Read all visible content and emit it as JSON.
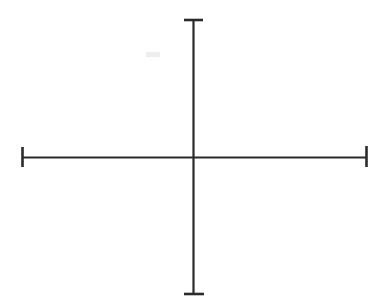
{
  "figure": {
    "kind": "axes-cross-diagram",
    "title": "Blank coordinate axes cross",
    "canvas": {
      "width": 380,
      "height": 308,
      "background": "#ffffff"
    },
    "stroke": {
      "color": "#2b2b2b",
      "axis_width": 2,
      "cap_width": 2.6
    },
    "origin": {
      "x": 193,
      "y": 157
    },
    "horizontal_axis": {
      "label": "horizontal-axis",
      "x1": 22,
      "y1": 157,
      "x2": 367,
      "y2": 157
    },
    "vertical_axis": {
      "label": "vertical-axis",
      "x1": 193,
      "y1": 19,
      "x2": 193,
      "y2": 295
    },
    "end_caps": [
      {
        "name": "top-cap",
        "orientation": "horizontal",
        "x1": 184,
        "y1": 20,
        "x2": 203,
        "y2": 20
      },
      {
        "name": "bottom-cap",
        "orientation": "horizontal",
        "x1": 184,
        "y1": 294,
        "x2": 204,
        "y2": 294
      },
      {
        "name": "left-cap",
        "orientation": "vertical",
        "x1": 22,
        "y1": 147,
        "x2": 22,
        "y2": 167
      },
      {
        "name": "right-cap",
        "orientation": "vertical",
        "x1": 366,
        "y1": 146,
        "x2": 366,
        "y2": 167
      }
    ],
    "artifacts": [
      {
        "name": "scan-smudge",
        "x": 146,
        "y": 52,
        "width": 14,
        "height": 5,
        "color": "#eeeeee"
      }
    ],
    "tick_labels": [],
    "annotations": [],
    "legend": []
  },
  "chart_data": {
    "type": "line",
    "title": "",
    "xlabel": "",
    "ylabel": "",
    "categories": [],
    "values": [],
    "series": [
      {
        "name": "horizontal-axis",
        "x": [
          22,
          367
        ],
        "y": [
          157,
          157
        ]
      },
      {
        "name": "vertical-axis",
        "x": [
          193,
          193
        ],
        "y": [
          19,
          295
        ]
      }
    ],
    "xlim": [
      0,
      380
    ],
    "ylim": [
      0,
      308
    ],
    "grid": false,
    "legend_position": "none",
    "annotations": []
  }
}
